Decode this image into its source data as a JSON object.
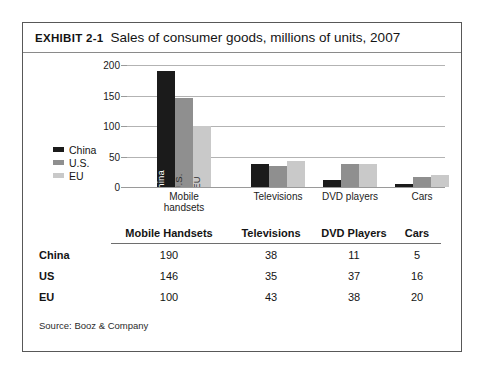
{
  "exhibit": {
    "label": "EXHIBIT 2-1",
    "title": "Sales of consumer goods, millions of units, 2007",
    "source": "Source: Booz & Company"
  },
  "chart_data": {
    "type": "bar",
    "title": "Sales of consumer goods, millions of units, 2007",
    "xlabel": "",
    "ylabel": "",
    "ylim": [
      0,
      200
    ],
    "yticks": [
      "0",
      "50",
      "100",
      "150",
      "200"
    ],
    "grid": true,
    "legend_position": "left",
    "categories": [
      "Mobile handsets",
      "Televisions",
      "DVD players",
      "Cars"
    ],
    "category_lines": [
      [
        "Mobile",
        "handsets"
      ],
      [
        "Televisions"
      ],
      [
        "DVD players"
      ],
      [
        "Cars"
      ]
    ],
    "series": [
      {
        "name": "China",
        "color": "#1b1b1b",
        "values": [
          190,
          38,
          11,
          5
        ]
      },
      {
        "name": "U.S.",
        "color": "#8f8f8f",
        "values": [
          146,
          35,
          37,
          16
        ]
      },
      {
        "name": "EU",
        "color": "#c9c9c9",
        "values": [
          100,
          43,
          38,
          20
        ]
      }
    ],
    "bar_inner_labels": [
      "China",
      "U.S.",
      "EU"
    ]
  },
  "legend": {
    "items": [
      {
        "label": "China",
        "color": "#1b1b1b"
      },
      {
        "label": "U.S.",
        "color": "#8f8f8f"
      },
      {
        "label": "EU",
        "color": "#c9c9c9"
      }
    ]
  },
  "table": {
    "headers": [
      "",
      "Mobile Handsets",
      "Televisions",
      "DVD Players",
      "Cars"
    ],
    "rows": [
      {
        "label": "China",
        "values": [
          "190",
          "38",
          "11",
          "5"
        ]
      },
      {
        "label": "US",
        "values": [
          "146",
          "35",
          "37",
          "16"
        ]
      },
      {
        "label": "EU",
        "values": [
          "100",
          "43",
          "38",
          "20"
        ]
      }
    ]
  }
}
